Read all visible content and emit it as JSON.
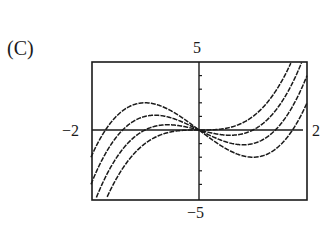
{
  "figure": {
    "panel_label": "(C)"
  },
  "chart_data": {
    "type": "line",
    "title": "",
    "panel": "(C)",
    "xlabel": "",
    "ylabel": "",
    "xlim": [
      -2,
      2
    ],
    "ylim": [
      -5,
      5
    ],
    "tick_labels": {
      "x_min": "−2",
      "x_max": "2",
      "y_min": "−5",
      "y_max": "5"
    },
    "grid": false,
    "legend": null,
    "series": [
      {
        "name": "y = x^3",
        "c": 0
      },
      {
        "name": "y = x^3 - x",
        "c": 1
      },
      {
        "name": "y = x^3 - 2x",
        "c": 2
      },
      {
        "name": "y = x^3 - 3x",
        "c": 3
      }
    ],
    "line_color": "#1a1a1a"
  }
}
